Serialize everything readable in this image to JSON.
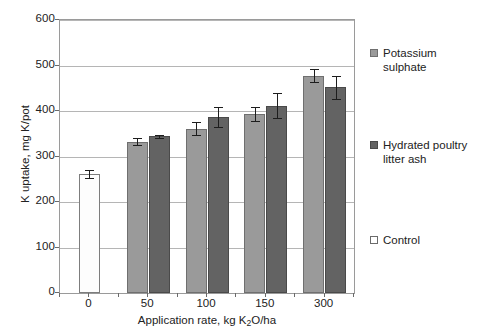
{
  "chart_data": {
    "type": "bar",
    "title": "",
    "xlabel": "Application rate, kg K2O/ha",
    "xlabel_parts": {
      "before": "Application rate, kg K",
      "sub": "2",
      "after": "O/ha"
    },
    "ylabel": "K uptake, mg K/pot",
    "ylim": [
      0,
      600
    ],
    "ytick_values": [
      0,
      100,
      200,
      300,
      400,
      500,
      600
    ],
    "ytick_labels": [
      "0",
      "100",
      "200",
      "300",
      "400",
      "500",
      "600"
    ],
    "grid": true,
    "legend_position": "right",
    "categories": [
      "0",
      "50",
      "100",
      "150",
      "300"
    ],
    "series": [
      {
        "name": "Control",
        "key": "control",
        "color": "#ffffff",
        "values": [
          261,
          null,
          null,
          null,
          null
        ],
        "errors": [
          9,
          null,
          null,
          null,
          null
        ]
      },
      {
        "name": "Potassium sulphate",
        "key": "sulphate",
        "color": "#9a9a9a",
        "values": [
          null,
          333,
          361,
          393,
          478
        ],
        "errors": [
          null,
          8,
          14,
          16,
          15
        ]
      },
      {
        "name": "Hydrated poultry litter ash",
        "key": "ash",
        "color": "#636363",
        "values": [
          null,
          344,
          386,
          412,
          452
        ],
        "errors": [
          null,
          3,
          22,
          27,
          26
        ]
      }
    ]
  },
  "legend": {
    "entries": [
      {
        "label": "Potassium sulphate",
        "key": "sulphate"
      },
      {
        "label": "Hydrated poultry litter ash",
        "key": "ash"
      },
      {
        "label": "Control",
        "key": "control"
      }
    ]
  }
}
